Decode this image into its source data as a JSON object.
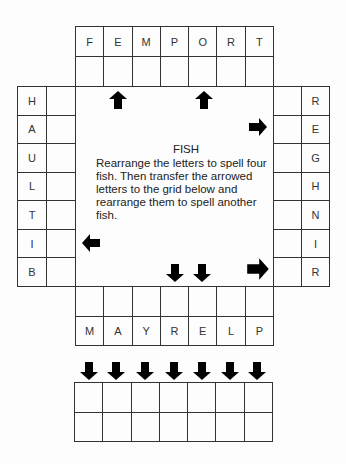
{
  "puzzle": {
    "title": "FISH",
    "instructions": "Rearrange the letters to spell four fish. Then transfer the arrowed letters to the grid below and rearrange them to spell another fish."
  },
  "top_grid": {
    "letters": [
      "F",
      "E",
      "M",
      "P",
      "O",
      "R",
      "T"
    ],
    "arrowed_columns": [
      2,
      5
    ],
    "arrow_direction": "up"
  },
  "left_grid": {
    "letters": [
      "H",
      "A",
      "U",
      "L",
      "T",
      "I",
      "B"
    ],
    "arrowed_rows": [
      6
    ],
    "arrow_direction": "left"
  },
  "right_grid": {
    "letters": [
      "R",
      "E",
      "G",
      "H",
      "N",
      "I",
      "R"
    ],
    "arrowed_rows": [
      2,
      7
    ],
    "arrow_direction": "right"
  },
  "bottom_grid": {
    "letters": [
      "M",
      "A",
      "Y",
      "R",
      "E",
      "L",
      "P"
    ],
    "arrowed_columns": [
      4,
      5
    ],
    "arrow_direction": "down"
  },
  "answer_grid": {
    "columns": 7,
    "rows": 2,
    "arrow_direction": "down"
  },
  "colors": {
    "line": "#333333",
    "arrow": "#000000",
    "background": "#fdfdfd"
  }
}
